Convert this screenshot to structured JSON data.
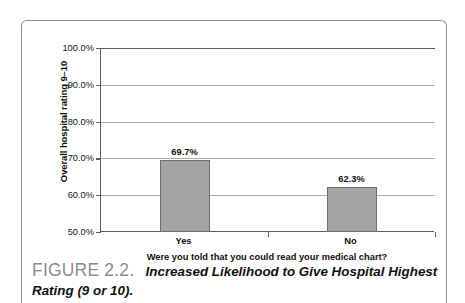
{
  "figure": {
    "label": "FIGURE 2.2.",
    "caption": "Increased Likelihood to Give Hospital Highest Rating (9 or 10)."
  },
  "chart_data": {
    "type": "bar",
    "title": "",
    "categories": [
      "Yes",
      "No"
    ],
    "values": [
      69.7,
      62.3
    ],
    "value_labels": [
      "69.7%",
      "62.3%"
    ],
    "xlabel": "Were you told that you could read your medical chart?",
    "ylabel": "Overall hospital rating 9–10",
    "ylim": [
      50.0,
      100.0
    ],
    "ytick_labels": [
      "100.0%",
      "90.0%",
      "80.0%",
      "70.0%",
      "60.0%",
      "50.0%"
    ],
    "ytick_values": [
      100.0,
      90.0,
      80.0,
      70.0,
      60.0,
      50.0
    ],
    "grid": true,
    "legend": "none",
    "bar_color": "#a3a3a3",
    "bar_edge_color": "#6f6f6f",
    "gridline_color": "#a9a9a9",
    "axis_color": "#5d5d5d"
  }
}
